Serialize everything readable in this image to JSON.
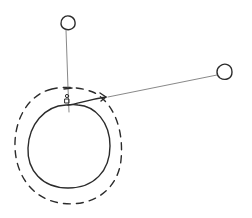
{
  "diagram": {
    "type": "hand-drawn-sketch",
    "background": "#ffffff",
    "ink_color": "#2b2b2b",
    "nodes": [
      {
        "id": "top-node",
        "shape": "small-circle",
        "label": ""
      },
      {
        "id": "right-node",
        "shape": "small-circle",
        "label": ""
      },
      {
        "id": "inner-body",
        "shape": "large-solid-circle",
        "label": ""
      },
      {
        "id": "outer-boundary",
        "shape": "dashed-circle",
        "label": ""
      },
      {
        "id": "small-figure",
        "shape": "tiny-figure",
        "label": ""
      }
    ],
    "edges": [
      {
        "from": "top-node",
        "to": "inner-body",
        "style": "thin-line",
        "marker": "crossbar-tick"
      },
      {
        "from": "right-node",
        "to": "outer-boundary",
        "style": "thin-line",
        "marker": "arrowhead"
      },
      {
        "from": "small-figure",
        "to": "outer-boundary",
        "style": "curved-arrow",
        "marker": "arrowhead"
      }
    ],
    "text": []
  }
}
